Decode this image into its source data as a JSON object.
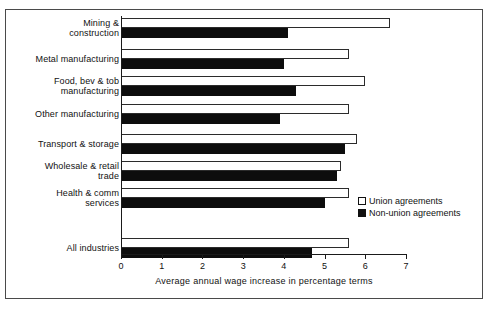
{
  "top_clip_text": "",
  "legend": {
    "entries": [
      {
        "label": "Union agreements",
        "swatch": "hollow-square",
        "color": "#ffffff"
      },
      {
        "label": "Non-union agreements",
        "swatch": "filled-square",
        "color": "#111111"
      }
    ]
  },
  "axis": {
    "xlabel": "Average annual wage increase in percentage terms",
    "ticks": [
      "0",
      "1",
      "2",
      "3",
      "4",
      "5",
      "6",
      "7"
    ]
  },
  "chart_data": {
    "type": "bar",
    "orientation": "horizontal",
    "title": "",
    "xlabel": "Average annual wage increase in percentage terms",
    "ylabel": "",
    "xlim": [
      0,
      7
    ],
    "xticks": [
      0,
      1,
      2,
      3,
      4,
      5,
      6,
      7
    ],
    "grid": false,
    "legend_position": "inside-right",
    "categories": [
      "Mining & construction",
      "Metal manufacturing",
      "Food, bev & tob manufacturing",
      "Other manufacturing",
      "Transport & storage",
      "Wholesale & retail trade",
      "Health & comm services",
      "All industries"
    ],
    "category_labels_wrapped": [
      [
        "Mining &",
        "construction"
      ],
      [
        "Metal manufacturing"
      ],
      [
        "Food, bev & tob",
        "manufacturing"
      ],
      [
        "Other manufacturing"
      ],
      [
        "Transport & storage"
      ],
      [
        "Wholesale & retail",
        "trade"
      ],
      [
        "Health & comm",
        "services"
      ],
      [
        "All industries"
      ]
    ],
    "series": [
      {
        "name": "Union agreements",
        "color": "#ffffff",
        "values": [
          6.6,
          5.6,
          6.0,
          5.6,
          5.8,
          5.4,
          5.6,
          5.6
        ]
      },
      {
        "name": "Non-union agreements",
        "color": "#111111",
        "values": [
          4.1,
          4.0,
          4.3,
          3.9,
          5.5,
          5.3,
          5.0,
          4.7
        ]
      }
    ]
  }
}
